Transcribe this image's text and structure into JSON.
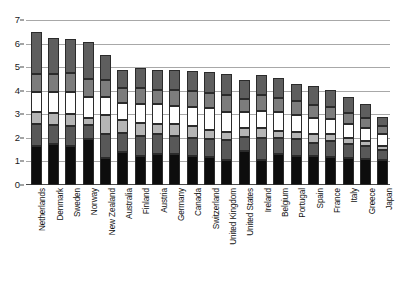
{
  "chart_data": {
    "type": "bar",
    "subtype": "stacked-bar",
    "title": "",
    "xlabel": "",
    "ylabel": "",
    "ylim": [
      0,
      7
    ],
    "ytick_labels": [
      "0",
      "1",
      "2",
      "3",
      "4",
      "5",
      "6",
      "7"
    ],
    "ytick_values": [
      0,
      1,
      2,
      3,
      4,
      5,
      6,
      7
    ],
    "grid": true,
    "legend": "none",
    "orientation": "vertical",
    "categories": [
      "Netherlands",
      "Denmark",
      "Sweden",
      "Norway",
      "New Zealand",
      "Australia",
      "Finland",
      "Austria",
      "Germany",
      "Canada",
      "Switzerland",
      "United Kingdom",
      "United States",
      "Ireland",
      "Belgium",
      "Portugal",
      "Spain",
      "France",
      "Italy",
      "Greece",
      "Japan"
    ],
    "series": [
      {
        "name": "segment-1",
        "color": "#0d0d0d",
        "values": [
          1.65,
          1.75,
          1.65,
          1.95,
          1.15,
          1.4,
          1.25,
          1.3,
          1.3,
          1.25,
          1.2,
          1.05,
          1.45,
          1.05,
          1.3,
          1.25,
          1.25,
          1.2,
          1.15,
          1.1,
          1.05
        ]
      },
      {
        "name": "segment-2",
        "color": "#585858",
        "values": [
          0.95,
          0.8,
          0.85,
          0.6,
          1.0,
          0.8,
          0.85,
          0.85,
          0.8,
          0.75,
          0.75,
          0.85,
          0.6,
          0.95,
          0.7,
          0.7,
          0.55,
          0.65,
          0.6,
          0.55,
          0.45
        ]
      },
      {
        "name": "segment-3",
        "color": "#b5b5b5",
        "values": [
          0.5,
          0.5,
          0.5,
          0.3,
          0.8,
          0.55,
          0.55,
          0.45,
          0.5,
          0.5,
          0.4,
          0.35,
          0.35,
          0.4,
          0.3,
          0.3,
          0.35,
          0.3,
          0.25,
          0.2,
          0.15
        ]
      },
      {
        "name": "segment-4",
        "color": "#ffffff",
        "values": [
          0.85,
          0.9,
          0.95,
          0.9,
          0.8,
          0.75,
          0.8,
          0.85,
          0.75,
          0.8,
          0.9,
          0.85,
          0.7,
          0.75,
          0.8,
          0.7,
          0.7,
          0.65,
          0.6,
          0.55,
          0.5
        ]
      },
      {
        "name": "segment-5",
        "color": "#7c7c7c",
        "values": [
          0.75,
          0.75,
          0.8,
          0.75,
          0.7,
          0.6,
          0.65,
          0.6,
          0.7,
          0.7,
          0.65,
          0.7,
          0.55,
          0.65,
          0.6,
          0.6,
          0.55,
          0.5,
          0.45,
          0.45,
          0.35
        ]
      },
      {
        "name": "segment-6",
        "color": "#5e5e5e",
        "values": [
          1.8,
          1.55,
          1.45,
          1.55,
          1.05,
          0.8,
          0.85,
          0.85,
          0.85,
          0.85,
          0.9,
          0.9,
          0.8,
          0.85,
          0.85,
          0.75,
          0.8,
          0.75,
          0.7,
          0.6,
          0.4
        ]
      }
    ],
    "totals": [
      6.5,
      6.25,
      6.2,
      6.05,
      5.5,
      4.9,
      4.95,
      4.9,
      4.9,
      4.85,
      4.8,
      4.7,
      4.45,
      4.65,
      4.55,
      4.3,
      4.2,
      4.05,
      3.75,
      3.45,
      2.9
    ]
  }
}
